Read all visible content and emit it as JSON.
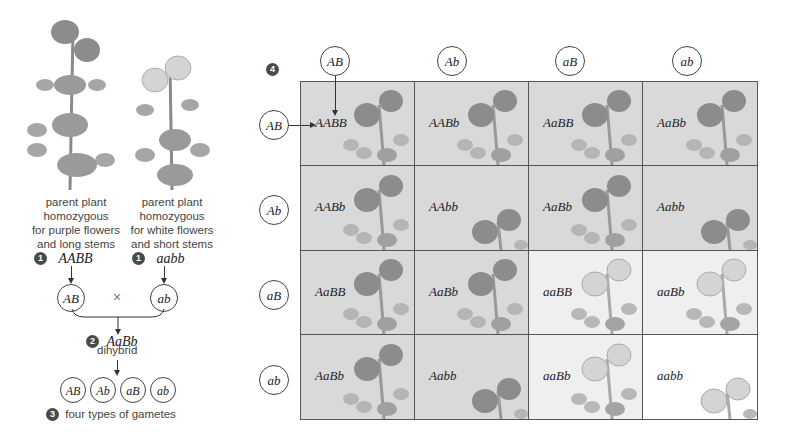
{
  "parents": {
    "left": {
      "caption_lines": [
        "parent plant",
        "homozygous",
        "for purple flowers",
        "and long stems"
      ],
      "step": "1",
      "genotype": "AABB",
      "gamete": "AB",
      "flower_color": "purple"
    },
    "right": {
      "caption_lines": [
        "parent plant",
        "homozygous",
        "for white flowers",
        "and short stems"
      ],
      "step": "1",
      "genotype": "aabb",
      "gamete": "ab",
      "flower_color": "white"
    },
    "cross_symbol": "×"
  },
  "dihybrid": {
    "step": "2",
    "genotype": "AaBb",
    "label": "dihybrid"
  },
  "gametes": {
    "step": "3",
    "types": [
      "AB",
      "Ab",
      "aB",
      "ab"
    ],
    "label": "four types of gametes"
  },
  "punnett": {
    "step": "4",
    "col_headers": [
      "AB",
      "Ab",
      "aB",
      "ab"
    ],
    "row_headers": [
      "AB",
      "Ab",
      "aB",
      "ab"
    ],
    "cells": [
      [
        {
          "g": "AABB",
          "c": "purple",
          "s": "long"
        },
        {
          "g": "AABb",
          "c": "purple",
          "s": "long"
        },
        {
          "g": "AaBB",
          "c": "purple",
          "s": "long"
        },
        {
          "g": "AaBb",
          "c": "purple",
          "s": "long"
        }
      ],
      [
        {
          "g": "AABb",
          "c": "purple",
          "s": "long"
        },
        {
          "g": "AAbb",
          "c": "purple",
          "s": "short"
        },
        {
          "g": "AaBb",
          "c": "purple",
          "s": "long"
        },
        {
          "g": "Aabb",
          "c": "purple",
          "s": "short"
        }
      ],
      [
        {
          "g": "AaBB",
          "c": "purple",
          "s": "long"
        },
        {
          "g": "AaBb",
          "c": "purple",
          "s": "long"
        },
        {
          "g": "aaBB",
          "c": "white",
          "s": "long"
        },
        {
          "g": "aaBb",
          "c": "white",
          "s": "long"
        }
      ],
      [
        {
          "g": "AaBb",
          "c": "purple",
          "s": "long"
        },
        {
          "g": "Aabb",
          "c": "purple",
          "s": "short"
        },
        {
          "g": "aaBb",
          "c": "white",
          "s": "long"
        },
        {
          "g": "aabb",
          "c": "white",
          "s": "short"
        }
      ]
    ]
  },
  "colors": {
    "purple_flower": "#8c8c8c",
    "white_flower": "#d4d4d4",
    "leaf": "#a6a6a6",
    "cell_purple_bg": "#d9d9d9",
    "cell_white_bg": "#efefef",
    "grid_line": "#555555"
  }
}
